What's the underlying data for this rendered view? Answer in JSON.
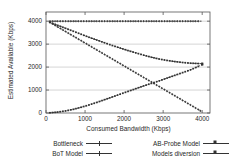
{
  "chart_data": {
    "type": "line",
    "title": "",
    "xlabel": "Consumed Bandwidth (Kbps)",
    "ylabel": "Estimated Available (Kbps)",
    "xlim": [
      0,
      4200
    ],
    "ylim": [
      0,
      4400
    ],
    "xticks": [
      0,
      1000,
      2000,
      3000,
      4000
    ],
    "xtick_labels": [
      "0",
      "1000",
      "2000",
      "3000",
      "4000"
    ],
    "yticks": [
      0,
      1000,
      2000,
      3000,
      4000
    ],
    "ytick_labels": [
      "0",
      "1000",
      "2000",
      "3000",
      "4000"
    ],
    "grid": true,
    "legend_position": "below",
    "x": [
      100,
      300,
      500,
      700,
      900,
      1100,
      1300,
      1500,
      1700,
      1900,
      2100,
      2300,
      2500,
      2700,
      2900,
      3100,
      3300,
      3500,
      3700,
      3900,
      4000
    ],
    "series": [
      {
        "name": "Bottleneck",
        "marker": "plus",
        "color": "#333333",
        "values": [
          4000,
          4000,
          4000,
          4000,
          4000,
          4000,
          4000,
          4000,
          4000,
          4000,
          4000,
          4000,
          4000,
          4000,
          4000,
          4000,
          4000,
          4000,
          4000,
          4000,
          4000
        ]
      },
      {
        "name": "BoT Model",
        "marker": "plus",
        "color": "#333333",
        "values": [
          3950,
          3750,
          3550,
          3350,
          3150,
          2950,
          2750,
          2550,
          2350,
          2150,
          1950,
          1750,
          1550,
          1350,
          1150,
          950,
          750,
          550,
          350,
          150,
          40
        ]
      },
      {
        "name": "AB-Probe Model",
        "marker": "square",
        "color": "#333333",
        "values": [
          3950,
          3820,
          3690,
          3560,
          3430,
          3300,
          3180,
          3060,
          2940,
          2830,
          2720,
          2620,
          2520,
          2430,
          2350,
          2290,
          2240,
          2200,
          2170,
          2155,
          2150
        ]
      },
      {
        "name": "Models diversion",
        "marker": "square",
        "color": "#333333",
        "values": [
          10,
          40,
          90,
          160,
          250,
          350,
          460,
          580,
          700,
          820,
          940,
          1060,
          1180,
          1290,
          1400,
          1520,
          1640,
          1760,
          1880,
          2030,
          2110
        ]
      }
    ],
    "annotations": {
      "crossing_point": {
        "x": 2750,
        "y": 1250
      }
    }
  },
  "legend": {
    "entries": [
      {
        "label": "Bottleneck",
        "marker": "plus"
      },
      {
        "label": "BoT Model",
        "marker": "plus"
      },
      {
        "label": "AB-Probe Model",
        "marker": "square"
      },
      {
        "label": "Models diversion",
        "marker": "square"
      }
    ]
  }
}
